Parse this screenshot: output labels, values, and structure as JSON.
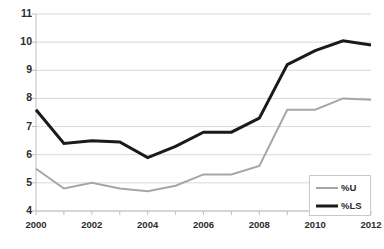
{
  "chart_data": {
    "type": "line",
    "title": "",
    "subtitle": "",
    "xlabel": "",
    "ylabel": "",
    "x": [
      2000,
      2001,
      2002,
      2003,
      2004,
      2005,
      2006,
      2007,
      2008,
      2009,
      2010,
      2011,
      2012
    ],
    "categories": [
      "2000",
      "2001",
      "2002",
      "2003",
      "2004",
      "2005",
      "2006",
      "2007",
      "2008",
      "2009",
      "2010",
      "2011",
      "2012"
    ],
    "xtick_labels": [
      "2000",
      "2002",
      "2004",
      "2006",
      "2008",
      "2010",
      "2012"
    ],
    "xtick_values": [
      2000,
      2002,
      2004,
      2006,
      2008,
      2010,
      2012
    ],
    "ytick_labels": [
      "4",
      "5",
      "6",
      "7",
      "8",
      "9",
      "10",
      "11"
    ],
    "ytick_values": [
      4,
      5,
      6,
      7,
      8,
      9,
      10,
      11
    ],
    "xlim": [
      2000,
      2012
    ],
    "ylim": [
      4,
      11
    ],
    "grid": "horizontal",
    "legend_position": "bottom-right",
    "series": [
      {
        "name": "%U",
        "color": "#a6a6a6",
        "line_width": 2,
        "values": [
          5.5,
          4.8,
          5.0,
          4.8,
          4.7,
          4.9,
          5.3,
          5.3,
          5.6,
          7.6,
          7.6,
          8.0,
          7.95
        ]
      },
      {
        "name": "%LS",
        "color": "#1a1a1a",
        "line_width": 3,
        "values": [
          7.6,
          6.4,
          6.5,
          6.45,
          5.9,
          6.3,
          6.8,
          6.8,
          7.3,
          9.2,
          9.7,
          10.05,
          9.9
        ]
      }
    ]
  },
  "legend": {
    "items": [
      {
        "label": "%U",
        "color": "#a6a6a6",
        "line_width": 2
      },
      {
        "label": "%LS",
        "color": "#1a1a1a",
        "line_width": 3
      }
    ]
  },
  "colors": {
    "gridline": "#d9d9d9",
    "axis": "#bfbfbf",
    "text": "#2b2b2b",
    "background": "#ffffff",
    "legend_border": "#c8c8c8"
  }
}
